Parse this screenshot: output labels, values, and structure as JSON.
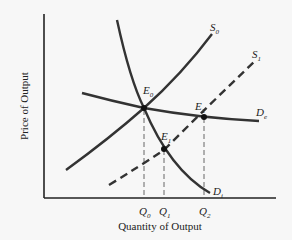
{
  "diagram": {
    "type": "supply-demand",
    "x_axis_label": "Quantity of Output",
    "y_axis_label": "Price of Output",
    "curves": [
      {
        "id": "S0",
        "label_main": "S",
        "label_sub": "0",
        "style": "solid"
      },
      {
        "id": "S1",
        "label_main": "S",
        "label_sub": "1",
        "style": "dashed"
      },
      {
        "id": "De",
        "label_main": "D",
        "label_sub": "e",
        "style": "solid"
      },
      {
        "id": "Di",
        "label_main": "D",
        "label_sub": "i",
        "style": "solid"
      }
    ],
    "points": [
      {
        "id": "E0",
        "label_main": "E",
        "label_sub": "0"
      },
      {
        "id": "E1",
        "label_main": "E",
        "label_sub": "1"
      },
      {
        "id": "E2",
        "label_main": "E",
        "label_sub": "2"
      }
    ],
    "ticks": [
      {
        "id": "Q0",
        "label_main": "Q",
        "label_sub": "0"
      },
      {
        "id": "Q1",
        "label_main": "Q",
        "label_sub": "1"
      },
      {
        "id": "Q2",
        "label_main": "Q",
        "label_sub": "2"
      }
    ]
  }
}
